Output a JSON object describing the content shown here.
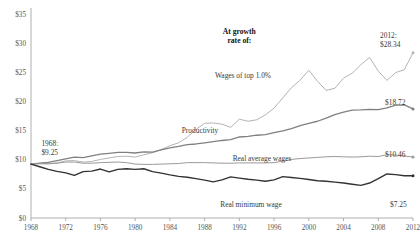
{
  "chart_data": {
    "type": "line",
    "title": "",
    "subtitle": "",
    "xlabel": "",
    "ylabel": "",
    "xlim": [
      1968,
      2012
    ],
    "ylim": [
      0,
      35
    ],
    "grid": false,
    "legend_position": "inline-labels",
    "y_ticks": [
      "$0",
      "$5",
      "$10",
      "$15",
      "$20",
      "$25",
      "$30",
      "$35"
    ],
    "y_tick_values": [
      0,
      5,
      10,
      15,
      20,
      25,
      30,
      35
    ],
    "x_ticks": [
      "1968",
      "1972",
      "1976",
      "1980",
      "1984",
      "1988",
      "1992",
      "1996",
      "2000",
      "2004",
      "2008",
      "2012"
    ],
    "x_tick_values": [
      1968,
      1972,
      1976,
      1980,
      1984,
      1988,
      1992,
      1996,
      2000,
      2004,
      2008,
      2012
    ],
    "annotations": [
      {
        "name": "growth-rate-note",
        "text_line1": "At growth",
        "text_line2": "rate of:",
        "x": 1992,
        "y": 31.5
      },
      {
        "name": "start-value",
        "text_line1": "1968:",
        "text_line2": "$9.25",
        "x": 1969.2,
        "y": 12.4
      }
    ],
    "x": [
      1968,
      1969,
      1970,
      1971,
      1972,
      1973,
      1974,
      1975,
      1976,
      1977,
      1978,
      1979,
      1980,
      1981,
      1982,
      1983,
      1984,
      1985,
      1986,
      1987,
      1988,
      1989,
      1990,
      1991,
      1992,
      1993,
      1994,
      1995,
      1996,
      1997,
      1998,
      1999,
      2000,
      2001,
      2002,
      2003,
      2004,
      2005,
      2006,
      2007,
      2008,
      2009,
      2010,
      2011,
      2012
    ],
    "series": [
      {
        "name": "Wages of top 1.0%",
        "label": "Wages of top 1.0%",
        "color": "#b4b4b4",
        "width": 1.0,
        "end_label": "2012:\n$28.34",
        "end_value": 28.34,
        "start_value": 9.25,
        "values": [
          9.25,
          9.35,
          9.3,
          9.45,
          9.8,
          9.85,
          9.6,
          9.7,
          10.05,
          10.3,
          10.55,
          10.6,
          10.45,
          10.85,
          11.2,
          11.75,
          12.4,
          12.9,
          13.85,
          15.2,
          16.25,
          16.3,
          16.1,
          15.55,
          16.95,
          16.6,
          16.85,
          17.7,
          18.85,
          20.6,
          22.35,
          23.65,
          25.35,
          23.45,
          21.9,
          22.25,
          24.0,
          24.85,
          26.3,
          27.55,
          25.2,
          23.6,
          24.95,
          25.45,
          28.34
        ]
      },
      {
        "name": "Productivity",
        "label": "Productivity",
        "color": "#808080",
        "width": 1.3,
        "end_label": "$18.72",
        "end_value": 18.72,
        "start_value": 9.25,
        "values": [
          9.25,
          9.4,
          9.55,
          9.85,
          10.15,
          10.45,
          10.35,
          10.65,
          10.95,
          11.1,
          11.25,
          11.25,
          11.15,
          11.35,
          11.3,
          11.7,
          12.05,
          12.3,
          12.6,
          12.7,
          12.9,
          13.1,
          13.3,
          13.45,
          13.9,
          14.0,
          14.2,
          14.3,
          14.65,
          14.95,
          15.35,
          15.85,
          16.25,
          16.6,
          17.15,
          17.75,
          18.15,
          18.5,
          18.55,
          18.65,
          18.6,
          18.9,
          19.35,
          19.4,
          18.72
        ]
      },
      {
        "name": "Real average wages",
        "label": "Real average wages",
        "color": "#9a9a9a",
        "width": 1.0,
        "end_label": "$10.46",
        "end_value": 10.46,
        "start_value": 9.25,
        "values": [
          9.25,
          9.3,
          9.3,
          9.4,
          9.6,
          9.6,
          9.4,
          9.4,
          9.5,
          9.55,
          9.6,
          9.5,
          9.25,
          9.2,
          9.2,
          9.25,
          9.3,
          9.35,
          9.5,
          9.5,
          9.5,
          9.45,
          9.4,
          9.4,
          9.45,
          9.45,
          9.45,
          9.45,
          9.5,
          9.75,
          10.05,
          10.2,
          10.3,
          10.4,
          10.5,
          10.55,
          10.5,
          10.45,
          10.5,
          10.6,
          10.55,
          10.85,
          10.8,
          10.65,
          10.46
        ]
      },
      {
        "name": "Real minimum wage",
        "label": "Real minimum wage",
        "color": "#333333",
        "width": 1.4,
        "end_label": "$7.25",
        "end_value": 7.25,
        "start_value": 9.25,
        "values": [
          9.25,
          8.8,
          8.35,
          8.0,
          7.75,
          7.3,
          7.95,
          8.05,
          8.4,
          7.9,
          8.35,
          8.45,
          8.35,
          8.45,
          7.95,
          7.7,
          7.4,
          7.15,
          7.0,
          6.75,
          6.5,
          6.2,
          6.55,
          7.05,
          6.85,
          6.65,
          6.5,
          6.3,
          6.55,
          7.1,
          6.95,
          6.8,
          6.6,
          6.4,
          6.3,
          6.15,
          6.0,
          5.8,
          5.6,
          6.0,
          6.75,
          7.55,
          7.45,
          7.25,
          7.25
        ]
      }
    ]
  }
}
